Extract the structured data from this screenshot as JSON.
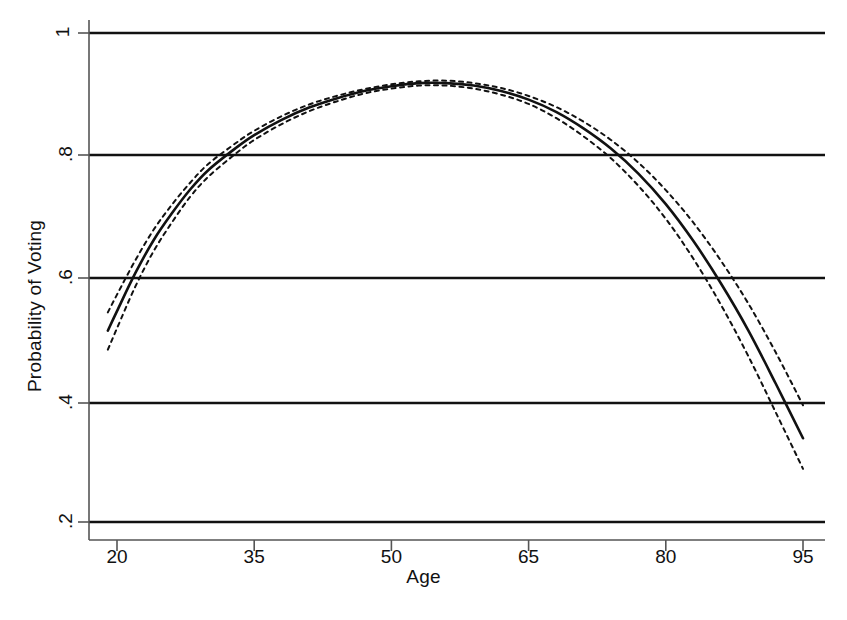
{
  "chart_data": {
    "type": "line",
    "title": "",
    "xlabel": "Age",
    "ylabel": "Probability of Voting",
    "xlim": [
      19,
      96
    ],
    "ylim": [
      0.17,
      1.02
    ],
    "grid": "horizontal",
    "legend": "none",
    "xticks": [
      20,
      35,
      50,
      65,
      80,
      95
    ],
    "xticklabels": [
      "20",
      "35",
      "50",
      "65",
      "80",
      "95"
    ],
    "yticks": [
      0.2,
      0.4,
      0.6,
      0.8,
      1
    ],
    "yticklabels": [
      ".2",
      ".4",
      ".6",
      ".8",
      "1"
    ],
    "series": [
      {
        "name": "Predicted probability",
        "style": "solid",
        "x": [
          19,
          20,
          22,
          24,
          26,
          28,
          30,
          33,
          35,
          38,
          41,
          44,
          47,
          50,
          53,
          56,
          59,
          62,
          65,
          68,
          71,
          74,
          77,
          80,
          83,
          86,
          89,
          92,
          95
        ],
        "values": [
          0.513,
          0.545,
          0.607,
          0.661,
          0.705,
          0.744,
          0.776,
          0.812,
          0.833,
          0.858,
          0.878,
          0.893,
          0.905,
          0.913,
          0.918,
          0.918,
          0.914,
          0.905,
          0.891,
          0.871,
          0.844,
          0.811,
          0.77,
          0.72,
          0.66,
          0.591,
          0.514,
          0.427,
          0.337
        ]
      },
      {
        "name": "Upper 95% confidence bound",
        "style": "dashed",
        "x": [
          19,
          20,
          22,
          24,
          26,
          28,
          30,
          33,
          35,
          38,
          41,
          44,
          47,
          50,
          53,
          56,
          59,
          62,
          65,
          68,
          71,
          74,
          77,
          80,
          83,
          86,
          89,
          92,
          95
        ],
        "values": [
          0.543,
          0.572,
          0.628,
          0.678,
          0.719,
          0.755,
          0.786,
          0.82,
          0.84,
          0.864,
          0.883,
          0.897,
          0.908,
          0.916,
          0.921,
          0.922,
          0.918,
          0.91,
          0.897,
          0.879,
          0.855,
          0.825,
          0.788,
          0.743,
          0.69,
          0.628,
          0.558,
          0.478,
          0.391
        ]
      },
      {
        "name": "Lower 95% confidence bound",
        "style": "dashed",
        "x": [
          19,
          20,
          22,
          24,
          26,
          28,
          30,
          33,
          35,
          38,
          41,
          44,
          47,
          50,
          53,
          56,
          59,
          62,
          65,
          68,
          71,
          74,
          77,
          80,
          83,
          86,
          89,
          92,
          95
        ],
        "values": [
          0.482,
          0.517,
          0.585,
          0.643,
          0.69,
          0.732,
          0.765,
          0.803,
          0.825,
          0.851,
          0.872,
          0.888,
          0.901,
          0.909,
          0.914,
          0.914,
          0.909,
          0.899,
          0.884,
          0.861,
          0.831,
          0.795,
          0.75,
          0.696,
          0.631,
          0.556,
          0.472,
          0.38,
          0.287
        ]
      }
    ],
    "colors": {
      "line": "#111111",
      "grid": "#111111",
      "axis": "#555555",
      "background": "#ffffff"
    }
  }
}
